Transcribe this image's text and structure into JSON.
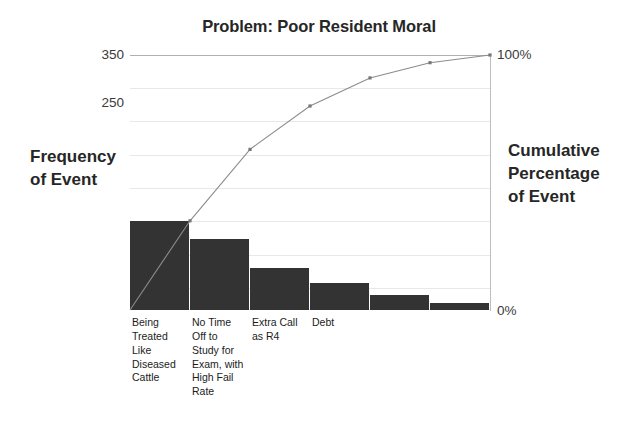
{
  "chart_data": {
    "type": "bar",
    "title": "Problem: Poor Resident Moral",
    "xlabel": "",
    "ylabel": "Frequency of Event",
    "y2label": "Cumulative Percentage of Event",
    "categories": [
      "Being Treated Like Diseased Cattle",
      "No Time Off to Study for Exam, with High Fail Rate",
      "Extra Call as R4",
      "Debt",
      "",
      ""
    ],
    "series": [
      {
        "name": "Frequency of Event",
        "type": "bar",
        "values": [
          122,
          97,
          58,
          37,
          21,
          10
        ]
      },
      {
        "name": "Cumulative Percentage of Event",
        "type": "line",
        "values": [
          35,
          63,
          80,
          91,
          97,
          100
        ]
      }
    ],
    "ylim": [
      0,
      350
    ],
    "y2lim": [
      0,
      100
    ],
    "yticks": [
      350,
      250
    ],
    "ytick_labels": [
      "350",
      "250"
    ],
    "y2ticks": [
      100,
      0
    ],
    "y2tick_labels": [
      "100%",
      "0%"
    ],
    "grid": true,
    "legend": "none"
  },
  "title": {
    "text": "Problem: Poor Resident Moral"
  },
  "axes": {
    "left_title_lines": [
      "Frequency",
      "of Event"
    ],
    "right_title_lines": [
      "Cumulative",
      "Percentage",
      "of Event"
    ],
    "y_ticks": [
      {
        "label": "350",
        "value": 350
      },
      {
        "label": "250",
        "value": 250
      }
    ],
    "y2_ticks": [
      {
        "label": "100%",
        "value": 100
      },
      {
        "label": "0%",
        "value": 0
      }
    ]
  },
  "categories": [
    {
      "lines": [
        "Being",
        "Treated",
        "Like",
        "Diseased",
        "Cattle"
      ],
      "frequency": 122,
      "cumulative_pct": 35
    },
    {
      "lines": [
        "No Time",
        "Off to",
        "Study for",
        "Exam, with",
        "High Fail",
        "Rate"
      ],
      "frequency": 97,
      "cumulative_pct": 63
    },
    {
      "lines": [
        "Extra Call",
        "as R4"
      ],
      "frequency": 58,
      "cumulative_pct": 80
    },
    {
      "lines": [
        "Debt"
      ],
      "frequency": 37,
      "cumulative_pct": 91
    },
    {
      "lines": [],
      "frequency": 21,
      "cumulative_pct": 97
    },
    {
      "lines": [],
      "frequency": 10,
      "cumulative_pct": 100
    }
  ],
  "colors": {
    "bar": "#333333",
    "line": "#8c8c8c",
    "grid": "#e8e8e8",
    "axis": "#b0b0b0",
    "text": "#262626"
  }
}
